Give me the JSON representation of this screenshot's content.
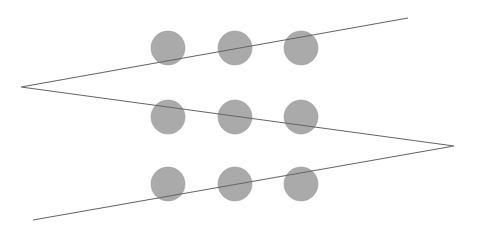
{
  "diagram": {
    "background": "#ffffff",
    "dot_color": "#aaaaaa",
    "dot_stroke": "#9a9a9a",
    "line_color": "#666666",
    "dot_radius": 17,
    "dots": [
      {
        "cx": 168,
        "cy": 48
      },
      {
        "cx": 235,
        "cy": 48
      },
      {
        "cx": 301,
        "cy": 48
      },
      {
        "cx": 168,
        "cy": 117
      },
      {
        "cx": 235,
        "cy": 117
      },
      {
        "cx": 301,
        "cy": 117
      },
      {
        "cx": 168,
        "cy": 184
      },
      {
        "cx": 235,
        "cy": 184
      },
      {
        "cx": 301,
        "cy": 184
      }
    ],
    "polyline": [
      {
        "x": 408,
        "y": 18
      },
      {
        "x": 21,
        "y": 87
      },
      {
        "x": 454,
        "y": 146
      },
      {
        "x": 33,
        "y": 220
      }
    ]
  }
}
